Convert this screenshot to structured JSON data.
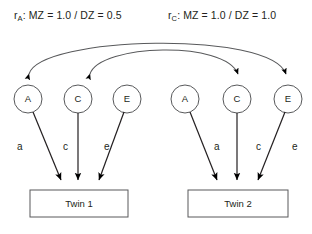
{
  "diagram": {
    "title_labels": [
      {
        "id": "rA",
        "prefix": "r",
        "subscript": "A",
        "text": ": MZ = 1.0 / DZ = 0.5"
      },
      {
        "id": "rC",
        "prefix": "r",
        "subscript": "C",
        "text": ": MZ = 1.0 / DZ = 1.0"
      }
    ],
    "latent_variables": [
      {
        "id": "twin1-A",
        "label": "A",
        "group": "twin1"
      },
      {
        "id": "twin1-C",
        "label": "C",
        "group": "twin1"
      },
      {
        "id": "twin1-E",
        "label": "E",
        "group": "twin1"
      },
      {
        "id": "twin2-A",
        "label": "A",
        "group": "twin2"
      },
      {
        "id": "twin2-C",
        "label": "C",
        "group": "twin2"
      },
      {
        "id": "twin2-E",
        "label": "E",
        "group": "twin2"
      }
    ],
    "path_coefficients": [
      {
        "id": "twin1-a",
        "label": "a",
        "group": "twin1"
      },
      {
        "id": "twin1-c",
        "label": "c",
        "group": "twin1"
      },
      {
        "id": "twin1-e",
        "label": "e",
        "group": "twin1"
      },
      {
        "id": "twin2-a",
        "label": "a",
        "group": "twin2"
      },
      {
        "id": "twin2-c",
        "label": "c",
        "group": "twin2"
      },
      {
        "id": "twin2-e",
        "label": "e",
        "group": "twin2"
      }
    ],
    "observed_variables": [
      {
        "id": "twin1-box",
        "label": "Twin 1"
      },
      {
        "id": "twin2-box",
        "label": "Twin 2"
      }
    ],
    "colors": {
      "stroke": "#58595b",
      "arrow_fill": "#000000",
      "text": "#231f20",
      "background": "#ffffff"
    }
  }
}
